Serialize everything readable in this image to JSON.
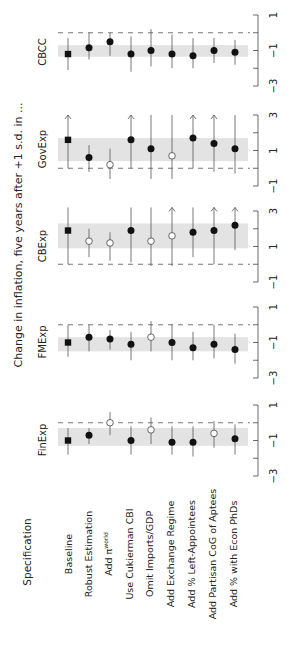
{
  "chart_data": {
    "type": "scatter",
    "orientation": "rotated-90-ccw",
    "ylabel": "Change in inflation, five years after +1 s.d. in ...",
    "xlabel": "Specification",
    "categories": [
      "Baseline",
      "Robust Estimation",
      "Add π^world",
      "Use Cukierman CBI",
      "Omit Imports/GDP",
      "Add Exchange Regime",
      "Add % Left-Appointees",
      "Add Partisan CoG of Aptees",
      "Add % with Econ PhDs"
    ],
    "panels": [
      {
        "name": "CBCC",
        "ticks": [
          1,
          -1,
          -3
        ],
        "ylim": [
          -3,
          1
        ],
        "band": [
          -1.35,
          -0.7
        ],
        "estimates": [
          -1.2,
          -0.85,
          -0.5,
          -1.2,
          -1.0,
          -1.2,
          -1.3,
          -1.0,
          -1.1
        ],
        "lower": [
          -2.1,
          -1.5,
          -1.3,
          -2.2,
          -1.9,
          -2.0,
          -2.0,
          -1.7,
          -1.8
        ],
        "upper": [
          -0.3,
          0.0,
          0.0,
          -0.2,
          0.2,
          -0.1,
          -0.3,
          -0.3,
          -0.4
        ],
        "markers": [
          "square",
          "filled",
          "filled",
          "filled",
          "filled",
          "filled",
          "filled",
          "filled",
          "filled"
        ],
        "arrows_up": [
          false,
          false,
          false,
          false,
          false,
          false,
          false,
          false,
          false
        ]
      },
      {
        "name": "GovExp",
        "ticks": [
          3,
          1,
          -1
        ],
        "ylim": [
          -1,
          3
        ],
        "band": [
          0.4,
          1.7
        ],
        "estimates": [
          1.6,
          0.6,
          0.2,
          1.6,
          1.1,
          0.7,
          1.7,
          1.4,
          1.1
        ],
        "lower": [
          0.0,
          -0.2,
          -0.6,
          0.0,
          -0.6,
          -0.6,
          0.0,
          -0.2,
          -0.3
        ],
        "upper": [
          3.0,
          1.3,
          1.1,
          3.0,
          3.0,
          3.0,
          3.0,
          3.0,
          3.0
        ],
        "markers": [
          "square",
          "filled",
          "open",
          "filled",
          "filled",
          "open",
          "filled",
          "filled",
          "filled"
        ],
        "arrows_up": [
          true,
          false,
          false,
          true,
          false,
          false,
          true,
          true,
          false
        ]
      },
      {
        "name": "CBExp",
        "ticks": [
          3,
          1,
          -1
        ],
        "ylim": [
          -1,
          3
        ],
        "band": [
          0.9,
          2.3
        ],
        "estimates": [
          1.9,
          1.3,
          1.2,
          1.9,
          1.3,
          1.6,
          1.8,
          1.9,
          2.2
        ],
        "lower": [
          0.0,
          0.4,
          0.2,
          0.1,
          -0.1,
          -0.1,
          0.4,
          0.0,
          0.8
        ],
        "upper": [
          3.2,
          2.0,
          1.8,
          3.2,
          3.2,
          3.2,
          3.2,
          3.2,
          3.2
        ],
        "markers": [
          "square",
          "open",
          "open",
          "filled",
          "open",
          "open",
          "filled",
          "filled",
          "filled"
        ],
        "arrows_up": [
          false,
          false,
          false,
          false,
          false,
          true,
          false,
          true,
          true
        ]
      },
      {
        "name": "FMExp",
        "ticks": [
          1,
          -1,
          -3
        ],
        "ylim": [
          -3,
          1
        ],
        "band": [
          -1.5,
          -0.7
        ],
        "estimates": [
          -1.0,
          -0.7,
          -0.8,
          -1.1,
          -0.7,
          -1.0,
          -1.3,
          -1.1,
          -1.4
        ],
        "lower": [
          -1.8,
          -1.5,
          -1.4,
          -2.0,
          -1.5,
          -2.0,
          -2.0,
          -1.9,
          -2.2
        ],
        "upper": [
          0.0,
          0.0,
          -0.3,
          -0.4,
          0.2,
          0.0,
          -0.4,
          0.0,
          -0.5
        ],
        "markers": [
          "square",
          "filled",
          "filled",
          "filled",
          "open",
          "filled",
          "filled",
          "filled",
          "filled"
        ],
        "arrows_up": [
          false,
          false,
          false,
          false,
          false,
          false,
          false,
          false,
          false
        ]
      },
      {
        "name": "FinExp",
        "ticks": [
          1,
          -1,
          -3
        ],
        "ylim": [
          -3,
          1
        ],
        "band": [
          -1.3,
          -0.3
        ],
        "estimates": [
          -1.0,
          -0.7,
          0.0,
          -1.0,
          -0.4,
          -1.1,
          -1.1,
          -0.6,
          -0.9
        ],
        "lower": [
          -1.8,
          -1.2,
          -0.7,
          -1.8,
          -1.2,
          -1.8,
          -1.9,
          -1.4,
          -1.8
        ],
        "upper": [
          -0.3,
          -0.3,
          0.6,
          -0.2,
          0.3,
          -0.2,
          -0.2,
          0.1,
          -0.1
        ],
        "markers": [
          "square",
          "filled",
          "open",
          "filled",
          "open",
          "filled",
          "filled",
          "open",
          "filled"
        ],
        "arrows_up": [
          false,
          false,
          false,
          false,
          false,
          false,
          false,
          false,
          false
        ]
      }
    ],
    "reference_line": 0,
    "grid": false
  },
  "labels": {
    "ylabel": "Change in inflation, five years after +1 s.d. in ...",
    "xlabel": "Specification",
    "specs": [
      "Baseline",
      "Robust Estimation",
      "Add π",
      "Use Cukierman CBI",
      "Omit Imports/GDP",
      "Add Exchange Regime",
      "Add % Left-Appointees",
      "Add Partisan CoG of Aptees",
      "Add % with Econ PhDs"
    ],
    "pi_superscript": "world",
    "panels": [
      "CBCC",
      "GovExp",
      "CBExp",
      "FMExp",
      "FinExp"
    ]
  }
}
